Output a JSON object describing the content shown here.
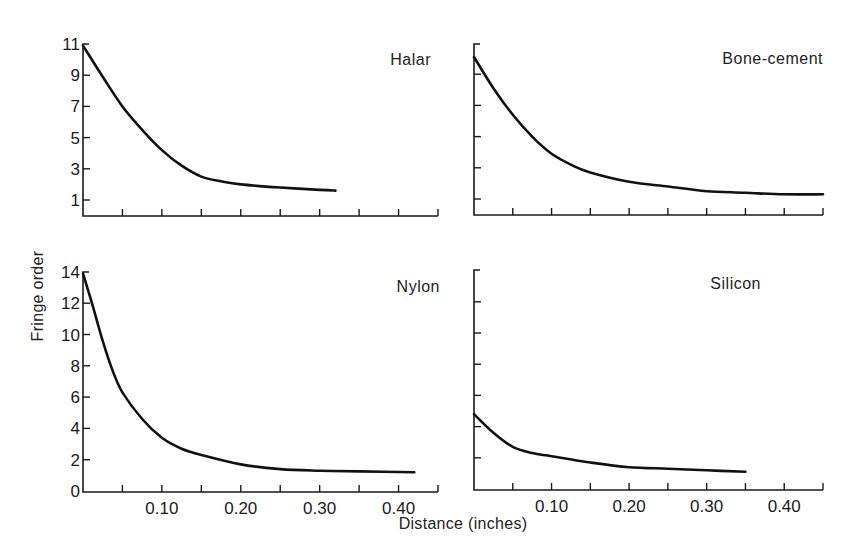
{
  "chart_data": [
    {
      "type": "line",
      "title": "Halar",
      "xlabel": "Distance (inches)",
      "ylabel": "Fringe order",
      "xlim": [
        0,
        0.45
      ],
      "ylim": [
        0,
        11
      ],
      "yticks": [
        1,
        3,
        5,
        7,
        9,
        11
      ],
      "xticks": [
        0.05,
        0.1,
        0.15,
        0.2,
        0.25,
        0.3,
        0.35,
        0.4,
        0.45
      ],
      "xtick_labels": [],
      "grid": false,
      "series": [
        {
          "name": "Halar",
          "x": [
            0.0,
            0.025,
            0.05,
            0.075,
            0.1,
            0.125,
            0.15,
            0.175,
            0.2,
            0.25,
            0.3,
            0.32
          ],
          "y": [
            10.9,
            8.9,
            7.0,
            5.5,
            4.2,
            3.2,
            2.5,
            2.2,
            2.0,
            1.8,
            1.65,
            1.6
          ]
        }
      ]
    },
    {
      "type": "line",
      "title": "Bone-cement",
      "xlabel": "Distance (inches)",
      "ylabel": "Fringe order",
      "xlim": [
        0,
        0.45
      ],
      "ylim": [
        0,
        11
      ],
      "yticks": [
        1,
        3,
        5,
        7,
        9,
        11
      ],
      "xticks": [
        0.05,
        0.1,
        0.15,
        0.2,
        0.25,
        0.3,
        0.35,
        0.4,
        0.45
      ],
      "xtick_labels": [],
      "grid": false,
      "series": [
        {
          "name": "Bone-cement",
          "x": [
            0.0,
            0.025,
            0.05,
            0.075,
            0.1,
            0.125,
            0.15,
            0.2,
            0.25,
            0.3,
            0.35,
            0.4,
            0.45
          ],
          "y": [
            10.1,
            8.1,
            6.4,
            5.0,
            3.9,
            3.2,
            2.7,
            2.1,
            1.8,
            1.5,
            1.4,
            1.3,
            1.3
          ]
        }
      ]
    },
    {
      "type": "line",
      "title": "Nylon",
      "xlabel": "Distance (inches)",
      "ylabel": "Fringe order",
      "xlim": [
        0,
        0.45
      ],
      "ylim": [
        0,
        14
      ],
      "yticks": [
        0,
        2,
        4,
        6,
        8,
        10,
        12,
        14
      ],
      "xticks": [
        0.05,
        0.1,
        0.15,
        0.2,
        0.25,
        0.3,
        0.35,
        0.4,
        0.45
      ],
      "xtick_labels": [
        "0.10",
        "0.20",
        "0.30",
        "0.40"
      ],
      "grid": false,
      "series": [
        {
          "name": "Nylon",
          "x": [
            0.0,
            0.0125,
            0.025,
            0.0375,
            0.05,
            0.075,
            0.1,
            0.125,
            0.15,
            0.2,
            0.25,
            0.3,
            0.35,
            0.42
          ],
          "y": [
            13.9,
            11.8,
            9.6,
            7.7,
            6.3,
            4.6,
            3.4,
            2.7,
            2.3,
            1.7,
            1.4,
            1.3,
            1.25,
            1.2
          ]
        }
      ]
    },
    {
      "type": "line",
      "title": "Silicon",
      "xlabel": "Distance (inches)",
      "ylabel": "Fringe order",
      "xlim": [
        0,
        0.45
      ],
      "ylim": [
        0,
        14
      ],
      "yticks": [
        0,
        2,
        4,
        6,
        8,
        10,
        12,
        14
      ],
      "xticks": [
        0.05,
        0.1,
        0.15,
        0.2,
        0.25,
        0.3,
        0.35,
        0.4,
        0.45
      ],
      "xtick_labels": [
        "0.10",
        "0.20",
        "0.30",
        "0.40"
      ],
      "grid": false,
      "series": [
        {
          "name": "Silicon",
          "x": [
            0.0,
            0.025,
            0.05,
            0.075,
            0.1,
            0.15,
            0.2,
            0.25,
            0.3,
            0.35
          ],
          "y": [
            4.8,
            3.6,
            2.7,
            2.3,
            2.1,
            1.7,
            1.4,
            1.3,
            1.2,
            1.1
          ]
        }
      ]
    }
  ],
  "figure": {
    "ylabel": "Fringe order",
    "xlabel": "Distance (inches)",
    "panels": [
      {
        "label": "Halar",
        "ytick_labels": [
          "11",
          "9",
          "7",
          "5",
          "3",
          "1"
        ]
      },
      {
        "label": "Bone-cement",
        "ytick_labels": []
      },
      {
        "label": "Nylon",
        "ytick_labels": [
          "14",
          "12",
          "10",
          "8",
          "6",
          "4",
          "2",
          "0"
        ]
      },
      {
        "label": "Silicon",
        "ytick_labels": []
      }
    ],
    "xtick_labels": [
      "0.10",
      "0.20",
      "0.30",
      "0.40"
    ]
  }
}
